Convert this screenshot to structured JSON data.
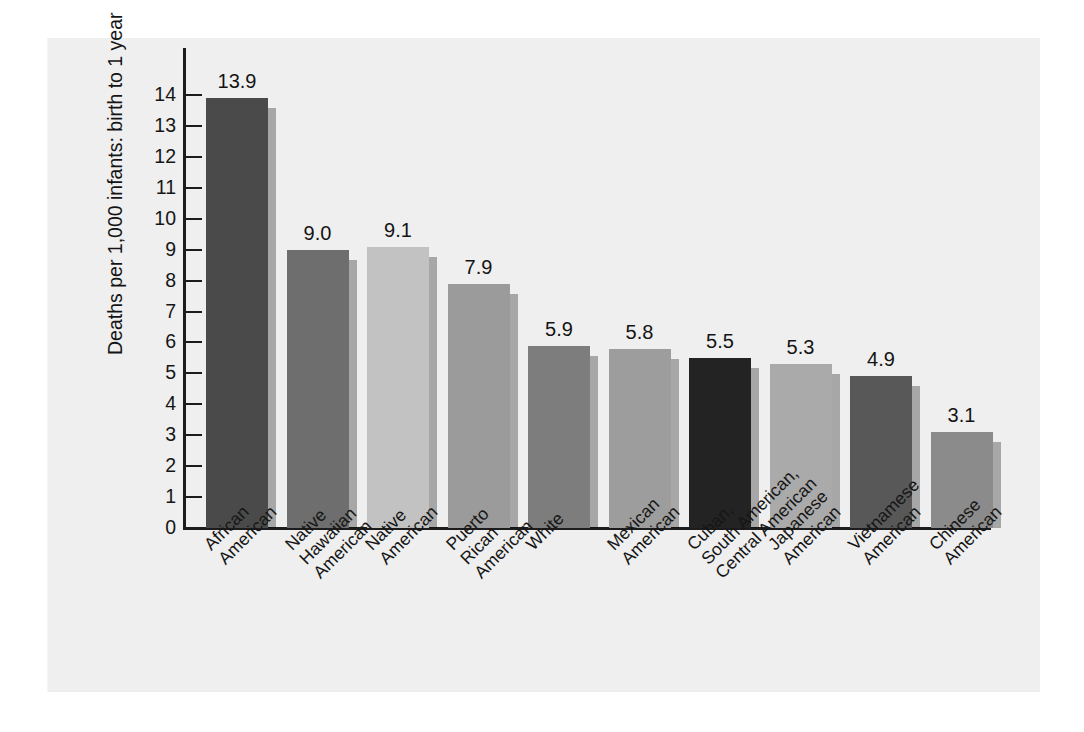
{
  "chart_data": {
    "type": "bar",
    "title": "",
    "subtitle": "",
    "xlabel": "",
    "ylabel": "Deaths per 1,000 infants: birth to 1 year",
    "ylim": [
      0,
      14
    ],
    "ytick_labels": [
      "14",
      "13",
      "12",
      "11",
      "10",
      "9",
      "8",
      "7",
      "6",
      "5",
      "4",
      "3",
      "2",
      "1",
      "0"
    ],
    "yticks": [
      14,
      13,
      12,
      11,
      10,
      9,
      8,
      7,
      6,
      5,
      4,
      3,
      2,
      1,
      0
    ],
    "grid": false,
    "legend": "none",
    "categories": [
      "African American",
      "Native Hawaiian American",
      "Native American",
      "Puerto Rican American",
      "White",
      "Mexican American",
      "Cuban, South American, Central American",
      "Japanese American",
      "Vietnamese American",
      "Chinese American"
    ],
    "category_lines": [
      [
        "African",
        "American"
      ],
      [
        "Native",
        "Hawaiian",
        "American"
      ],
      [
        "Native",
        "American"
      ],
      [
        "Puerto",
        "Rican",
        "American"
      ],
      [
        "White"
      ],
      [
        "Mexican",
        "American"
      ],
      [
        "Cuban,",
        "South American,",
        "Central American"
      ],
      [
        "Japanese",
        "American"
      ],
      [
        "Vietnamese",
        "American"
      ],
      [
        "Chinese",
        "American"
      ]
    ],
    "values": [
      13.9,
      9.0,
      9.1,
      7.9,
      5.9,
      5.8,
      5.5,
      5.3,
      4.9,
      3.1
    ],
    "value_labels": [
      "13.9",
      "9.0",
      "9.1",
      "7.9",
      "5.9",
      "5.8",
      "5.5",
      "5.3",
      "4.9",
      "3.1"
    ],
    "bar_colors": [
      "#4a4a4a",
      "#6e6e6e",
      "#c2c2c2",
      "#9b9b9b",
      "#7d7d7d",
      "#9d9d9d",
      "#232323",
      "#aaaaaa",
      "#585858",
      "#8b8b8b"
    ]
  },
  "page": {
    "background_color": "#ffffff",
    "panel_color": "#efefef",
    "axis_color": "#1c1c1c",
    "text_color": "#161616"
  }
}
